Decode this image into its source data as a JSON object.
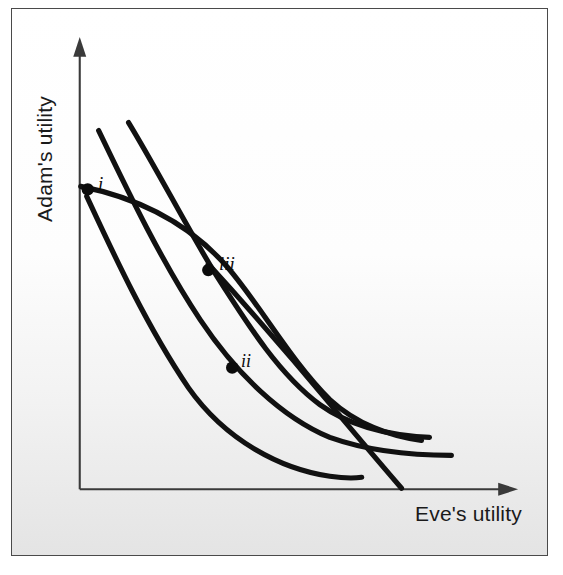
{
  "figure": {
    "background_top": "#ffffff",
    "background_bottom": "#e4e4e4",
    "border_color": "#4a4a4a",
    "curve_color": "#111111",
    "axis_color": "#3a3a3a"
  },
  "axes": {
    "y_label": "Adam's utility",
    "x_label": "Eve's utility",
    "x_axis_arrow": "arrow-right",
    "y_axis_arrow": "arrow-up",
    "origin_px": [
      79,
      490
    ],
    "x_axis_end_px": [
      515,
      490
    ],
    "y_axis_end_px": [
      79,
      40
    ]
  },
  "points": [
    {
      "id": "i",
      "label": "i",
      "x_px": 87,
      "y_px": 189,
      "label_x_px": 97,
      "label_y_px": 172
    },
    {
      "id": "ii",
      "label": "ii",
      "x_px": 232,
      "y_px": 368,
      "label_x_px": 240,
      "label_y_px": 350
    },
    {
      "id": "iii",
      "label": "iii",
      "x_px": 208,
      "y_px": 270,
      "label_x_px": 218,
      "label_y_px": 252
    }
  ],
  "chart_data": {
    "type": "line",
    "xlabel": "Eve's utility",
    "ylabel": "Adam's utility",
    "xlim": [
      79,
      515
    ],
    "ylim": [
      490,
      40
    ],
    "grid": false,
    "legend": null,
    "axes_arrows": true,
    "annotations": [
      {
        "text": "i",
        "x_px": 87,
        "y_px": 189,
        "style": "italic"
      },
      {
        "text": "ii",
        "x_px": 232,
        "y_px": 368,
        "style": "italic"
      },
      {
        "text": "iii",
        "x_px": 208,
        "y_px": 270,
        "style": "italic"
      }
    ],
    "series": [
      {
        "name": "utility-possibility-frontier",
        "description": "Concave frontier starting at point i on the vertical axis, bending right and downward to the lower right.",
        "path": "M 80 186 C 130 196, 185 218, 228 268 C 262 308, 290 360, 330 400 C 356 424, 390 437, 422 441",
        "points_px": [
          [
            80,
            186
          ],
          [
            118,
            193
          ],
          [
            160,
            207
          ],
          [
            200,
            238
          ],
          [
            228,
            268
          ],
          [
            262,
            308
          ],
          [
            296,
            362
          ],
          [
            330,
            400
          ],
          [
            372,
            430
          ],
          [
            422,
            441
          ]
        ]
      },
      {
        "name": "indifference-curve-upper",
        "description": "Steep curve from upper area through point iii, flattening toward the right edge.",
        "path": "M 128 122 C 156 168, 186 226, 214 272 C 246 322, 278 374, 320 405 C 352 428, 392 436, 430 438",
        "points_px": [
          [
            128,
            122
          ],
          [
            150,
            160
          ],
          [
            176,
            208
          ],
          [
            200,
            248
          ],
          [
            214,
            272
          ],
          [
            246,
            322
          ],
          [
            282,
            378
          ],
          [
            320,
            405
          ],
          [
            376,
            432
          ],
          [
            430,
            438
          ]
        ]
      },
      {
        "name": "indifference-curve-middle",
        "description": "Curve from upper-left passing through point ii, flattening to the right and ending near x=450.",
        "path": "M 98 130 C 124 184, 160 260, 200 320 C 236 374, 282 418, 330 438 C 372 453, 416 456, 452 456",
        "points_px": [
          [
            98,
            130
          ],
          [
            118,
            172
          ],
          [
            146,
            228
          ],
          [
            178,
            286
          ],
          [
            200,
            320
          ],
          [
            240,
            380
          ],
          [
            286,
            422
          ],
          [
            330,
            438
          ],
          [
            396,
            455
          ],
          [
            452,
            456
          ]
        ]
      },
      {
        "name": "indifference-curve-lower",
        "description": "Lowest indifference curve from upper-left, below the others, terminating at about x=362 near the x-axis.",
        "path": "M 86 196 C 112 252, 146 326, 188 388 C 226 442, 282 470, 330 477 C 344 479, 355 479, 362 478",
        "points_px": [
          [
            86,
            196
          ],
          [
            108,
            240
          ],
          [
            136,
            300
          ],
          [
            168,
            358
          ],
          [
            188,
            388
          ],
          [
            228,
            444
          ],
          [
            282,
            470
          ],
          [
            330,
            477
          ],
          [
            362,
            478
          ]
        ]
      },
      {
        "name": "contract-curve-steep",
        "description": "Steep descending curve crossing the other curves near point iii and meeting the horizontal axis at about x=402.",
        "path": "M 208 264 C 250 310, 290 356, 330 404 C 360 440, 384 468, 402 489",
        "points_px": [
          [
            208,
            264
          ],
          [
            238,
            298
          ],
          [
            270,
            334
          ],
          [
            302,
            372
          ],
          [
            330,
            404
          ],
          [
            362,
            442
          ],
          [
            385,
            468
          ],
          [
            402,
            489
          ]
        ]
      }
    ]
  }
}
